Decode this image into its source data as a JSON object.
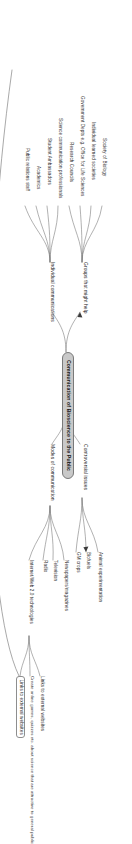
{
  "diagram": {
    "title": "Communication of Bioscience to the Public",
    "type": "mind-map",
    "orientation": "rotated-90-clockwise",
    "root": {
      "label": "Communication of Bioscience to the Public"
    },
    "branches": [
      {
        "id": "controversial-issues",
        "label": "Controversial issues",
        "children": [
          {
            "id": "animal-experimentation",
            "label": "Animal experimentation",
            "style": "plain"
          },
          {
            "id": "biofuels",
            "label": "Biofuels",
            "style": "plain"
          },
          {
            "id": "gm-crops",
            "label": "GM crops",
            "style": "plain"
          }
        ]
      },
      {
        "id": "modes-of-communication",
        "label": "Modes of communication",
        "children": [
          {
            "id": "newspapers-magazines",
            "label": "Newspapers/magazines",
            "style": "plain"
          },
          {
            "id": "television",
            "label": "Television",
            "style": "plain"
          },
          {
            "id": "radio",
            "label": "Radio",
            "style": "plain"
          },
          {
            "id": "internet-web2",
            "label": "Internet/Web 2.0 technologies",
            "style": "plain"
          }
        ]
      },
      {
        "id": "groups-that-might-help",
        "label": "Groups that might help",
        "children": [
          {
            "id": "society-of-biology",
            "label": "Society of Biology",
            "style": "plain"
          },
          {
            "id": "individual-learned-societies",
            "label": "Individual learned societies",
            "style": "plain"
          },
          {
            "id": "government-depts",
            "label": "Government Depts e.g. Office for Life Sciences",
            "style": "plain"
          },
          {
            "id": "research-councils",
            "label": "Research Councils",
            "style": "plain"
          }
        ]
      },
      {
        "id": "individual-communications",
        "label": "Individual communications",
        "children": [
          {
            "id": "science-communication-professionals",
            "label": "Science communication professionals",
            "style": "plain"
          },
          {
            "id": "student-ambassadors",
            "label": "Student Ambassadors",
            "style": "plain"
          },
          {
            "id": "academics",
            "label": "Academics",
            "style": "plain"
          },
          {
            "id": "public-relations-staff",
            "label": "Public relations staff",
            "style": "plain"
          }
        ]
      }
    ],
    "web_outputs": [
      {
        "id": "links-to-external-websites-1",
        "label": "Links to external websites",
        "style": "plain"
      },
      {
        "id": "create-online-games",
        "label": "Create online games, quizzes etc. about science that are attractive to general public",
        "style": "plain"
      },
      {
        "id": "links-to-external-websites-2",
        "label": "Links to external websites",
        "style": "boxed"
      }
    ],
    "colors": {
      "root_fill": "#c9c9c9",
      "root_stroke": "#7a7a7a",
      "node_stroke": "#8e8e8e",
      "connector": "#6f6f6f",
      "text": "#2b2b2b",
      "background": "#ffffff"
    }
  }
}
